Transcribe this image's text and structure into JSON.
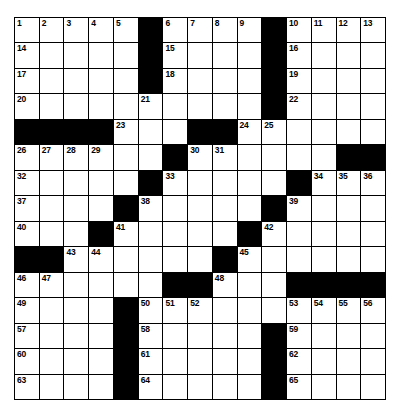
{
  "puzzle": {
    "rows": 15,
    "cols": 15,
    "colors": {
      "block": "#000000",
      "cell": "#ffffff",
      "line": "#000000"
    },
    "grid": [
      [
        "1",
        "2",
        "3",
        "4",
        "5",
        "#",
        "6",
        "7",
        "8",
        "9",
        "#",
        "10",
        "11",
        "12",
        "13"
      ],
      [
        "14",
        "",
        "",
        "",
        "",
        "#",
        "15",
        "",
        "",
        "",
        "#",
        "16",
        "",
        "",
        ""
      ],
      [
        "17",
        "",
        "",
        "",
        "",
        "#",
        "18",
        "",
        "",
        "",
        "#",
        "19",
        "",
        "",
        ""
      ],
      [
        "20",
        "",
        "",
        "",
        "",
        "21",
        "",
        "",
        "",
        "",
        "#",
        "22",
        "",
        "",
        ""
      ],
      [
        "#",
        "#",
        "#",
        "#",
        "23",
        "",
        "",
        "#",
        "#",
        "24",
        "25",
        "",
        "",
        "",
        ""
      ],
      [
        "26",
        "27",
        "28",
        "29",
        "",
        "",
        "#",
        "30",
        "31",
        "",
        "",
        "",
        "",
        "#",
        "#"
      ],
      [
        "32",
        "",
        "",
        "",
        "",
        "#",
        "33",
        "",
        "",
        "",
        "",
        "#",
        "34",
        "35",
        "36"
      ],
      [
        "37",
        "",
        "",
        "",
        "#",
        "38",
        "",
        "",
        "",
        "",
        "#",
        "39",
        "",
        "",
        ""
      ],
      [
        "40",
        "",
        "",
        "#",
        "41",
        "",
        "",
        "",
        "",
        "#",
        "42",
        "",
        "",
        "",
        ""
      ],
      [
        "#",
        "#",
        "43",
        "44",
        "",
        "",
        "",
        "",
        "#",
        "45",
        "",
        "",
        "",
        "",
        ""
      ],
      [
        "46",
        "47",
        "",
        "",
        "",
        "",
        "#",
        "#",
        "48",
        "",
        "",
        "#",
        "#",
        "#",
        "#"
      ],
      [
        "49",
        "",
        "",
        "",
        "#",
        "50",
        "51",
        "52",
        "",
        "",
        "",
        "53",
        "54",
        "55",
        "56"
      ],
      [
        "57",
        "",
        "",
        "",
        "#",
        "58",
        "",
        "",
        "",
        "",
        "#",
        "59",
        "",
        "",
        ""
      ],
      [
        "60",
        "",
        "",
        "",
        "#",
        "61",
        "",
        "",
        "",
        "",
        "#",
        "62",
        "",
        "",
        ""
      ],
      [
        "63",
        "",
        "",
        "",
        "#",
        "64",
        "",
        "",
        "",
        "",
        "#",
        "65",
        "",
        "",
        ""
      ]
    ]
  }
}
